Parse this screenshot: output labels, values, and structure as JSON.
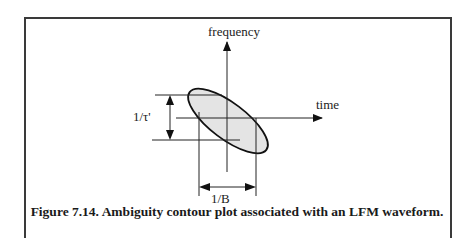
{
  "figure": {
    "caption": "Figure 7.14. Ambiguity contour plot associated with an LFM waveform.",
    "labels": {
      "y_axis": "frequency",
      "x_axis": "time",
      "vertical_extent": "1/τ'",
      "horizontal_extent": "1/B"
    },
    "colors": {
      "ellipse_fill": "#e4e4e4",
      "line": "#222222"
    }
  }
}
